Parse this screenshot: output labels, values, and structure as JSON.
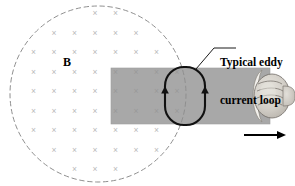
{
  "figure": {
    "background_color": "#ffffff",
    "width": 295,
    "height": 186
  },
  "field_region": {
    "name": "magnetic-field-region",
    "shape": "circle",
    "center_x": 98,
    "center_y": 94,
    "radius": 88,
    "border_style": "dashed",
    "border_color": "#8a8a8a",
    "fill": "none",
    "label": "B",
    "label_x": 63,
    "label_y": 56,
    "marker_glyph": "×",
    "marker_color": "#b9b9b9",
    "marker_meaning": "field-into-page",
    "marker_grid": {
      "start_x": 13,
      "start_y": 13,
      "spacing_x": 20.5,
      "spacing_y": 19.5,
      "cols": 10,
      "rows": 9
    }
  },
  "plate": {
    "name": "conducting-plate",
    "x": 111,
    "y": 68,
    "width": 159,
    "height": 56,
    "fill_color": "#a8a8a8",
    "edge_color": "#9a9a9a"
  },
  "eddy_loop": {
    "name": "eddy-current-loop",
    "center_x": 185,
    "center_y": 96,
    "width": 40,
    "height": 58,
    "corner_radius": 19,
    "stroke_color": "#000000",
    "stroke_width": 2,
    "left_arrow_direction": "up",
    "right_arrow_direction": "up"
  },
  "callout": {
    "name": "eddy-loop-callout",
    "label_lines": [
      "Typical eddy",
      "current loop"
    ],
    "line_color": "#000000",
    "points": [
      [
        196,
        69
      ],
      [
        214,
        48
      ],
      [
        236,
        48
      ]
    ]
  },
  "hand": {
    "name": "hand-gripping-plate",
    "center_x": 268,
    "center_y": 96,
    "skin_color": "#d4d0c9",
    "outline_color": "#6f6a64"
  },
  "motion_arrow": {
    "name": "plate-motion-arrow",
    "x_start": 244,
    "x_end": 285,
    "y": 135,
    "direction": "right",
    "color": "#000000"
  }
}
